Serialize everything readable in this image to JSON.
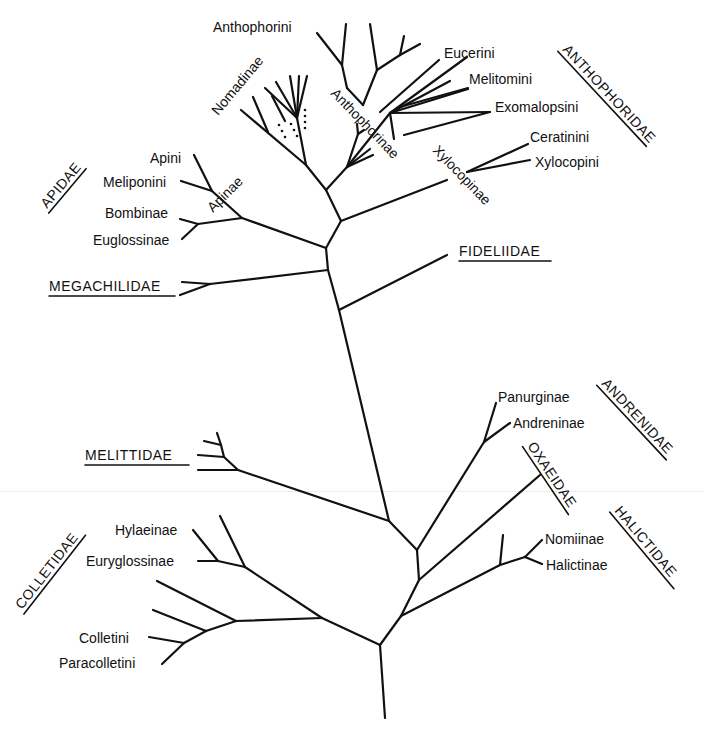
{
  "diagram": {
    "type": "phylogenetic-tree",
    "families": [
      {
        "label": "ANTHOPHORIDAE",
        "underlined": true
      },
      {
        "label": "APIDAE",
        "underlined": true
      },
      {
        "label": "FIDELIIDAE",
        "underlined": true
      },
      {
        "label": "MEGACHILIDAE",
        "underlined": true
      },
      {
        "label": "ANDRENIDAE",
        "underlined": true
      },
      {
        "label": "OXAEIDAE",
        "underlined": true
      },
      {
        "label": "MELITTIDAE",
        "underlined": true
      },
      {
        "label": "HALICTIDAE",
        "underlined": true
      },
      {
        "label": "COLLETIDAE",
        "underlined": true
      }
    ],
    "subfamilies": {
      "nomadinae": "Nomadinae",
      "anthophorinae": "Anthophorinae",
      "xylocopinae": "Xylocopinae",
      "apinae": "Apinae",
      "bombinae": "Bombinae",
      "euglossinae": "Euglossinae",
      "panurginae": "Panurginae",
      "andreninae": "Andreninae",
      "nomiinae": "Nomiinae",
      "halictinae": "Halictinae",
      "hylaeinae": "Hylaeinae",
      "euryglossinae": "Euryglossinae"
    },
    "tribes": {
      "anthophorini": "Anthophorini",
      "eucerini": "Eucerini",
      "melitomini": "Melitomini",
      "exomalopsini": "Exomalopsini",
      "ceratinini": "Ceratinini",
      "xylocopini": "Xylocopini",
      "apini": "Apini",
      "meliponini": "Meliponini",
      "colletini": "Colletini",
      "paracolletini": "Paracolletini"
    },
    "family_labels": {
      "anthophoridae": "ANTHOPHORIDAE",
      "apidae": "APIDAE",
      "fideliidae": "FIDELIIDAE",
      "megachilidae": "MEGACHILIDAE",
      "andrenidae": "ANDRENIDAE",
      "oxaeidae": "OXAEIDAE",
      "melittidae": "MELITTIDAE",
      "halictidae": "HALICTIDAE",
      "colletidae": "COLLETIDAE"
    },
    "colors": {
      "line": "#111111",
      "background": "#ffffff"
    }
  }
}
